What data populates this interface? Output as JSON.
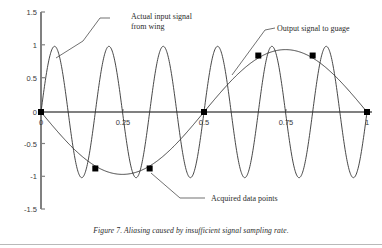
{
  "caption": "Figure 7. Aliasing caused by insufficient signal sampling rate.",
  "annotations": {
    "input_line1": "Actual input signal",
    "input_line2": "from wing",
    "output": "Output signal to guage",
    "samples": "Acquired data points"
  },
  "axes": {
    "y_ticks": [
      "1.5",
      "1",
      "0.5",
      "0",
      "-0.5",
      "-1",
      "-1.5"
    ],
    "x_ticks": [
      "0",
      "0.25",
      "0.5",
      "0.75",
      "1"
    ]
  },
  "colors": {
    "axis": "#808080",
    "curve": "#333333",
    "marker": "#000000",
    "text": "#2b2b2b",
    "rule": "#b9b9b9"
  },
  "chart_data": {
    "type": "line",
    "title": "",
    "xlabel": "",
    "ylabel": "",
    "xlim": [
      0,
      1
    ],
    "ylim": [
      -1.5,
      1.5
    ],
    "grid": false,
    "legend": "annotations",
    "x_ticks": [
      0,
      0.25,
      0.5,
      0.75,
      1
    ],
    "y_ticks": [
      1.5,
      1,
      0.5,
      0,
      -0.5,
      -1,
      -1.5
    ],
    "series": [
      {
        "name": "Actual input signal from wing",
        "type": "line",
        "formula": "sin(2*pi*6*x)",
        "frequency_cycles": 6,
        "amplitude": 1,
        "phase": 0,
        "samples_per_cycle": 120
      },
      {
        "name": "Output signal to guage",
        "type": "line",
        "formula": "sin(2*pi*1*x + pi)",
        "frequency_cycles": 1,
        "amplitude": 0.95,
        "phase": 3.14159265,
        "samples_per_cycle": 160
      },
      {
        "name": "Acquired data points",
        "type": "scatter",
        "marker": "square",
        "x": [
          0,
          0.1666,
          0.3333,
          0.5,
          0.6666,
          0.8333,
          1
        ],
        "y": [
          0,
          -0.86,
          -0.86,
          0,
          0.86,
          0.86,
          0
        ]
      }
    ]
  }
}
